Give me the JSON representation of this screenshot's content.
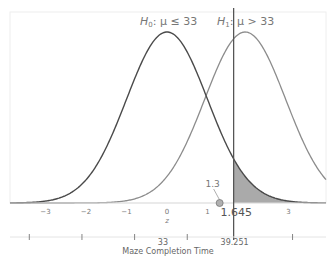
{
  "chart_data": {
    "type": "line",
    "title": "",
    "hypotheses": {
      "h0": {
        "symbol": "H",
        "subscript": "0",
        "text": ": μ ≤ 33",
        "mean_z": 0
      },
      "h1": {
        "symbol": "H",
        "subscript": "1",
        "text": ": μ > 33",
        "mean_z": 1.93
      }
    },
    "series": [
      {
        "name": "H0 distribution",
        "mean_z": 0,
        "sd": 1,
        "color": "#4a4a4a"
      },
      {
        "name": "H1 distribution",
        "mean_z": 1.93,
        "sd": 1,
        "color": "#8c8c8c"
      }
    ],
    "z_axis": {
      "label": "z",
      "ticks": [
        -3,
        -2,
        -1,
        0,
        1,
        3
      ],
      "tick_labels": [
        "−3",
        "−2",
        "−1",
        "0",
        "1",
        "3"
      ],
      "xlim": [
        -4.1,
        3.9
      ]
    },
    "critical_value": {
      "z": 1.645,
      "label": "1.645",
      "raw_label": "39.251"
    },
    "observed": {
      "z": 1.3,
      "label": "1.3"
    },
    "shaded_region": {
      "distribution": "H0",
      "from_z": 1.645,
      "color": "#aaaaaa"
    },
    "raw_axis": {
      "label": "Maze Completion Time",
      "tick_z": [
        -3.4,
        -2.1,
        -0.8,
        0.5,
        3.1
      ],
      "center_label": "33",
      "center_z": -0.1
    }
  }
}
